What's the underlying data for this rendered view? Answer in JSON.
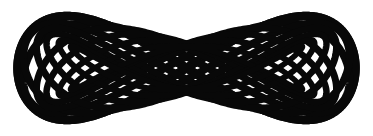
{
  "artwork": {
    "title": "Interlaced Infinity Knot",
    "subject": "decorative celtic-style lemniscate knot",
    "canvas": {
      "width": 373,
      "height": 136,
      "background_color": "#ffffff"
    },
    "ink_color": "#080808",
    "stroke_color": "#080808",
    "composition": {
      "symmetry": "bilateral, mirrored about vertical center and horizontal center",
      "center_x": 186.5,
      "center_y": 68,
      "ink_bounds": {
        "left": 18,
        "top": 13,
        "right": 356,
        "bottom": 125
      },
      "lobes": 2,
      "crossing_region": "center weave lattice between x=120 and x=250"
    },
    "strand_widths": {
      "outer": 8.5,
      "mid": 7.5,
      "inner": 6.5,
      "innermost": 5.5
    },
    "strands": [
      {
        "name": "outer-lemniscate",
        "amplitude_x": 169,
        "amplitude_y": 52,
        "width": 8.5,
        "phase": 0
      },
      {
        "name": "second-lemniscate",
        "amplitude_x": 163,
        "amplitude_y": 45,
        "width": 7.5,
        "phase": 0.13
      },
      {
        "name": "third-lemniscate",
        "amplitude_x": 150,
        "amplitude_y": 40,
        "width": 7,
        "phase": 0.27
      },
      {
        "name": "fourth-lemniscate",
        "amplitude_x": 140,
        "amplitude_y": 34,
        "width": 6.5,
        "phase": 0.4
      },
      {
        "name": "inner-lemniscate",
        "amplitude_x": 128,
        "amplitude_y": 28,
        "width": 6,
        "phase": 0.53
      },
      {
        "name": "innermost-lemniscate",
        "amplitude_x": 116,
        "amplitude_y": 22,
        "width": 5.5,
        "phase": 0.66
      }
    ]
  }
}
